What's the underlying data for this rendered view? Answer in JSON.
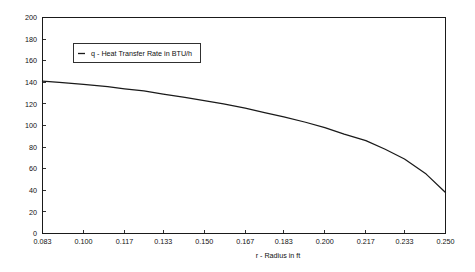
{
  "chart_data": {
    "type": "line",
    "title": "",
    "subtitle": "",
    "xlabel": "r - Radius in ft",
    "ylabel": "",
    "xlim": [
      0.083,
      0.25
    ],
    "ylim": [
      0,
      200
    ],
    "grid": false,
    "legend_position": "top-left-inside",
    "x_tick_labels": [
      "0.083",
      "0.100",
      "0.117",
      "0.133",
      "0.150",
      "0.167",
      "0.183",
      "0.200",
      "0.217",
      "0.233",
      "0.250"
    ],
    "x_ticks": [
      0.083,
      0.1,
      0.117,
      0.133,
      0.15,
      0.167,
      0.183,
      0.2,
      0.217,
      0.233,
      0.25
    ],
    "y_tick_labels": [
      "0",
      "20",
      "40",
      "60",
      "80",
      "100",
      "120",
      "140",
      "160",
      "180",
      "200"
    ],
    "y_ticks": [
      0,
      20,
      40,
      60,
      80,
      100,
      120,
      140,
      160,
      180,
      200
    ],
    "series": [
      {
        "name": "q - Heat Transfer Rate in BTU/h",
        "x": [
          0.083,
          0.09,
          0.1,
          0.11,
          0.117,
          0.125,
          0.133,
          0.142,
          0.15,
          0.158,
          0.167,
          0.175,
          0.183,
          0.192,
          0.2,
          0.208,
          0.217,
          0.225,
          0.233,
          0.242,
          0.25
        ],
        "values": [
          141,
          140,
          138,
          136,
          134,
          132,
          129,
          126,
          123,
          120,
          116,
          112,
          108,
          103,
          98,
          92,
          86,
          78,
          69,
          55,
          38
        ]
      }
    ]
  },
  "legend": {
    "entries": [
      {
        "label": "q - Heat Transfer Rate in BTU/h",
        "marker": "line-dash",
        "color": "#1a1a1a"
      }
    ]
  },
  "axes": {
    "x_axis_title": "r - Radius in ft",
    "y_axis_title": ""
  },
  "colors": {
    "background": "#ffffff",
    "axis": "#1a1a1a",
    "series": "#1a1a1a",
    "text": "#111111"
  }
}
